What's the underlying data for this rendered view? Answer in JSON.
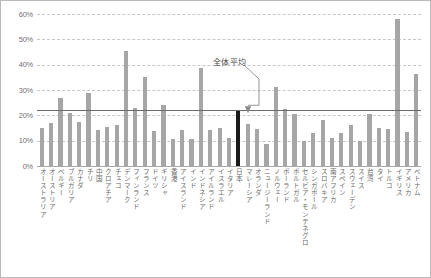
{
  "chart_data": {
    "type": "bar",
    "title": "",
    "xlabel": "",
    "ylabel": "",
    "ylim": [
      0,
      60
    ],
    "ytick_labels": [
      "60%",
      "50%",
      "40%",
      "30%",
      "20%",
      "10%",
      "0%"
    ],
    "ytick_values": [
      60,
      50,
      40,
      30,
      20,
      10,
      0
    ],
    "grid": true,
    "legend": "none",
    "categories": [
      "オーストラリア",
      "オーストリア",
      "ベルギー",
      "ブルガリア",
      "カナダ",
      "チリ",
      "中国",
      "クロアチア",
      "チェコ",
      "デンマーク",
      "フィンランド",
      "フランス",
      "ドイツ",
      "ギリシャ",
      "香港",
      "アイスランド",
      "インド",
      "インドネシア",
      "アイルランド",
      "イスラエル",
      "イタリア",
      "日本",
      "マレーシア",
      "オランダ",
      "ニュージーランド",
      "ノルウェー",
      "ポーランド",
      "ポルトガル",
      "セルビア・モンテネグロ",
      "シンガポール",
      "スロバキア",
      "南アフリカ",
      "スペイン",
      "スウェーデン",
      "スイス",
      "台湾",
      "タイ",
      "トルコ",
      "イギリス",
      "アメリカ",
      "ベトナム"
    ],
    "values": [
      15.0,
      16.8,
      27.0,
      21.0,
      17.2,
      29.0,
      14.2,
      15.5,
      16.0,
      45.5,
      23.0,
      35.0,
      14.0,
      24.0,
      10.5,
      14.2,
      10.5,
      38.5,
      14.2,
      15.2,
      11.2,
      22.0,
      16.5,
      14.5,
      8.8,
      31.0,
      22.5,
      20.5,
      10.0,
      13.0,
      18.0,
      11.0,
      13.0,
      16.0,
      9.8,
      20.5,
      15.0,
      14.5,
      58.0,
      13.5,
      36.5
    ],
    "highlight_category": "日本",
    "highlight_index": 21,
    "highlight_color": "#1a1a1a",
    "bar_color": "#a6a6a6",
    "average_line": {
      "label": "全体平均",
      "value": 22.0,
      "color": "#6b6b6b"
    }
  }
}
